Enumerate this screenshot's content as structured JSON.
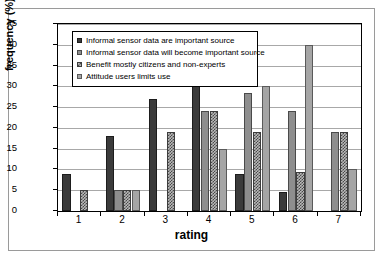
{
  "chart_data": {
    "type": "bar",
    "title": "",
    "xlabel": "rating",
    "ylabel": "frequency (%)",
    "categories": [
      "1",
      "2",
      "3",
      "4",
      "5",
      "6",
      "7"
    ],
    "ylim": [
      0,
      45
    ],
    "yticks": [
      0,
      5,
      10,
      15,
      20,
      25,
      30,
      35,
      40,
      45
    ],
    "grid": true,
    "legend_position": "top-left-inside",
    "series": [
      {
        "name": "Informal sensor data are important source",
        "fill": "dark-solid",
        "color": "#3b3b3b",
        "values": [
          9,
          18,
          27,
          32,
          9,
          4.5,
          0
        ]
      },
      {
        "name": "Informal sensor data will become important source",
        "fill": "gray-solid",
        "color": "#8e8e8e",
        "values": [
          0,
          5,
          0,
          24,
          28.5,
          24,
          19
        ]
      },
      {
        "name": "Benefit mostly citizens and non-experts",
        "fill": "checkered",
        "color": "#b9b9b9",
        "values": [
          5,
          5,
          19,
          24,
          19,
          9.5,
          19
        ]
      },
      {
        "name": "Attitude users limits use",
        "fill": "light-solid",
        "color": "#a5a5a5",
        "values": [
          0,
          5,
          0,
          15,
          30,
          40,
          10
        ]
      }
    ]
  }
}
